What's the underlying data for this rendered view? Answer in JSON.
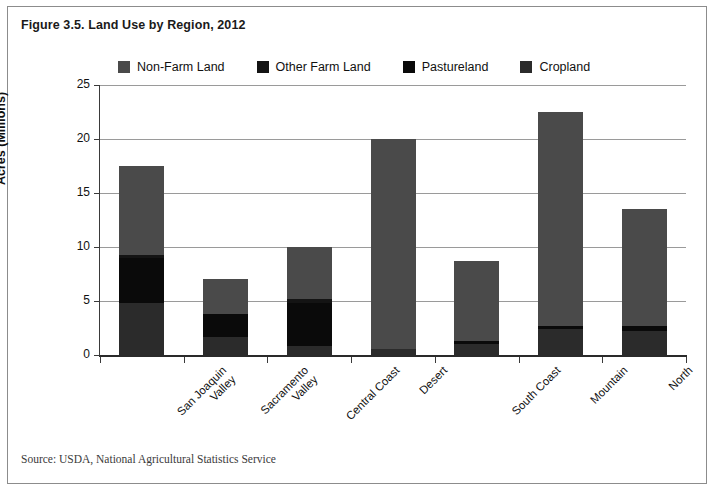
{
  "figure": {
    "title": "Figure 3.5. Land Use by Region, 2012",
    "source": "Source: USDA, National Agricultural Statistics Service"
  },
  "colors": {
    "non_farm_land": "#4a4a4a",
    "other_farm_land": "#141414",
    "pastureland": "#0a0a0a",
    "cropland": "#2b2b2b",
    "gridline": "#9a9a9a",
    "axis": "#2a2a2a",
    "border": "#8c8c8c",
    "text": "#111111"
  },
  "chart_data": {
    "type": "bar",
    "stacked": true,
    "title": "Figure 3.5. Land Use by Region, 2012",
    "xlabel": "",
    "ylabel": "Acres (Millions)",
    "ylim": [
      0,
      25
    ],
    "yticks": [
      0,
      5,
      10,
      15,
      20,
      25
    ],
    "grid": true,
    "legend_position": "top",
    "categories": [
      "San Joaquin Valley",
      "Sacramento Valley",
      "Central Coast",
      "Desert",
      "South Coast",
      "Mountain",
      "North"
    ],
    "series": [
      {
        "name": "Cropland",
        "values": [
          4.8,
          1.7,
          0.8,
          0.55,
          1.0,
          2.4,
          2.2
        ]
      },
      {
        "name": "Pastureland",
        "values": [
          4.2,
          2.1,
          4.0,
          0.0,
          0.3,
          0.3,
          0.5
        ]
      },
      {
        "name": "Other Farm Land",
        "values": [
          0.3,
          0.0,
          0.4,
          0.0,
          0.0,
          0.0,
          0.0
        ]
      },
      {
        "name": "Non-Farm Land",
        "values": [
          8.2,
          3.2,
          4.8,
          19.45,
          7.4,
          19.8,
          10.8
        ]
      }
    ],
    "totals": [
      17.5,
      7.0,
      10.0,
      20.0,
      8.7,
      22.5,
      13.5
    ]
  },
  "legend": {
    "items": [
      {
        "label": "Non-Farm Land",
        "color": "#4a4a4a"
      },
      {
        "label": "Other Farm Land",
        "color": "#141414"
      },
      {
        "label": "Pastureland",
        "color": "#0a0a0a"
      },
      {
        "label": "Cropland",
        "color": "#2b2b2b"
      }
    ]
  },
  "axes": {
    "y_title": "Acres (Millions)",
    "y_ticks": [
      "25",
      "20",
      "15",
      "10",
      "5",
      "0"
    ],
    "x_labels": [
      "San Joaquin\nValley",
      "Sacramento\nValley",
      "Central Coast",
      "Desert",
      "South Coast",
      "Mountain",
      "North"
    ]
  }
}
